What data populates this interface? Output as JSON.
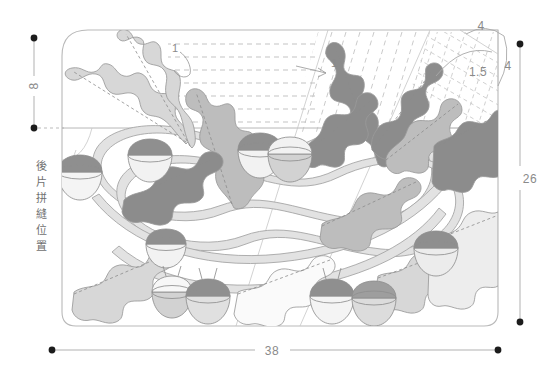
{
  "document": {
    "type": "sewing-pattern-technical-drawing",
    "title": "Oak leaf and acorn embroidery placement pattern"
  },
  "dimensions": {
    "left_vertical": {
      "label": "8",
      "name": "top-margin-height"
    },
    "right_vertical": {
      "label": "26",
      "name": "panel-height"
    },
    "bottom_horizontal": {
      "label": "38",
      "name": "panel-width"
    },
    "corner_top": {
      "label": "4",
      "name": "corner-offset-top"
    },
    "corner_right": {
      "label": "4",
      "name": "corner-offset-right"
    },
    "corner_arc": {
      "label": "1.5",
      "name": "corner-radius"
    },
    "stripe_spacing_left": {
      "label": "1",
      "name": "horizontal-stripe-spacing"
    },
    "stripe_spacing_right": {
      "label": "1",
      "name": "diagonal-stripe-spacing"
    }
  },
  "annotations": {
    "seam_note": "後片拼縫位置"
  },
  "palette": {
    "leaf_dark": "#8c8c8c",
    "leaf_mid": "#bdbdbd",
    "leaf_light": "#d7d7d7",
    "leaf_pale": "#efefef",
    "vine": "#e2e2e2",
    "acorn_cap_dark": "#8f8f8f",
    "acorn_cap_mid": "#b6b6b6",
    "acorn_nut_light": "#f0f0f0",
    "acorn_nut_mid": "#d2d2d2",
    "outline": "#b9b9b9",
    "dim_text": "#8a8a8a",
    "dot": "#1c1c1c",
    "background": "#ffffff"
  }
}
